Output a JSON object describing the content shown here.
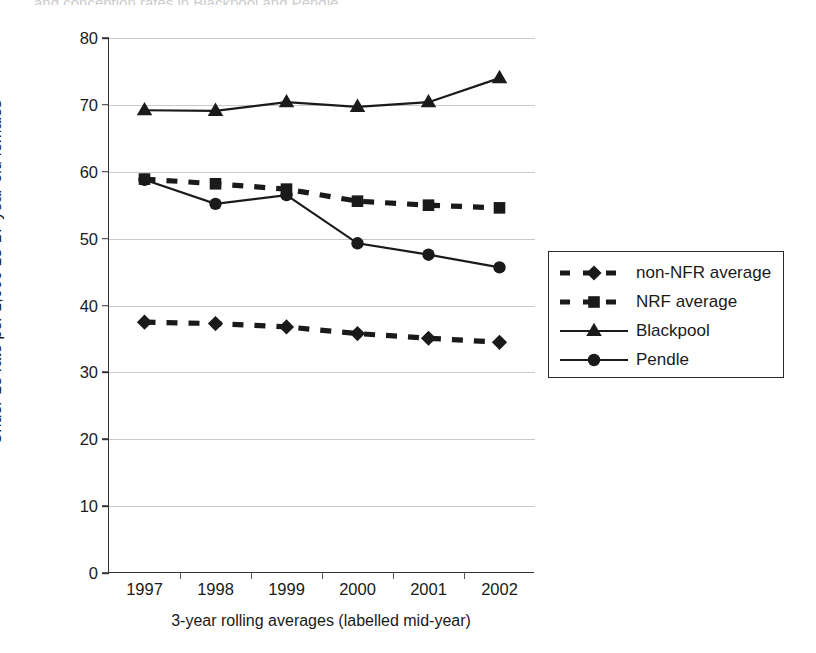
{
  "figure": {
    "caption_remnant": "and conception rates in Blackpool and Pendle"
  },
  "chart_data": {
    "type": "line",
    "title": "",
    "xlabel": "3-year rolling averages (labelled mid-year)",
    "ylabel": "Under-18 rate per 1,000 15-17-year-old females",
    "categories": [
      "1997",
      "1998",
      "1999",
      "2000",
      "2001",
      "2002"
    ],
    "ylim": [
      0,
      80
    ],
    "yticks": [
      0,
      10,
      20,
      30,
      40,
      50,
      60,
      70,
      80
    ],
    "ytick_labels": [
      "0",
      "10",
      "20",
      "30",
      "40",
      "50",
      "60",
      "70",
      "80"
    ],
    "grid": "horizontal",
    "legend_position": "right",
    "series": [
      {
        "name": "non-NFR average",
        "marker": "diamond",
        "line": "dashed",
        "color": "#1a1a1a",
        "values": [
          37.5,
          37.3,
          36.8,
          35.8,
          35.1,
          34.5
        ]
      },
      {
        "name": "NRF average",
        "marker": "square",
        "line": "dashed",
        "color": "#1a1a1a",
        "values": [
          58.9,
          58.2,
          57.4,
          55.6,
          55.0,
          54.6
        ]
      },
      {
        "name": "Blackpool",
        "marker": "triangle",
        "line": "solid",
        "color": "#1a1a1a",
        "values": [
          69.2,
          69.1,
          70.4,
          69.7,
          70.4,
          74.0
        ]
      },
      {
        "name": "Pendle",
        "marker": "circle",
        "line": "solid",
        "color": "#1a1a1a",
        "values": [
          58.8,
          55.2,
          56.5,
          49.3,
          47.6,
          45.7
        ]
      }
    ]
  },
  "legend": {
    "items": [
      {
        "label": "non-NFR average",
        "marker": "diamond",
        "line": "dashed"
      },
      {
        "label": "NRF average",
        "marker": "square",
        "line": "dashed"
      },
      {
        "label": "Blackpool",
        "marker": "triangle",
        "line": "solid"
      },
      {
        "label": "Pendle",
        "marker": "circle",
        "line": "solid"
      }
    ]
  }
}
